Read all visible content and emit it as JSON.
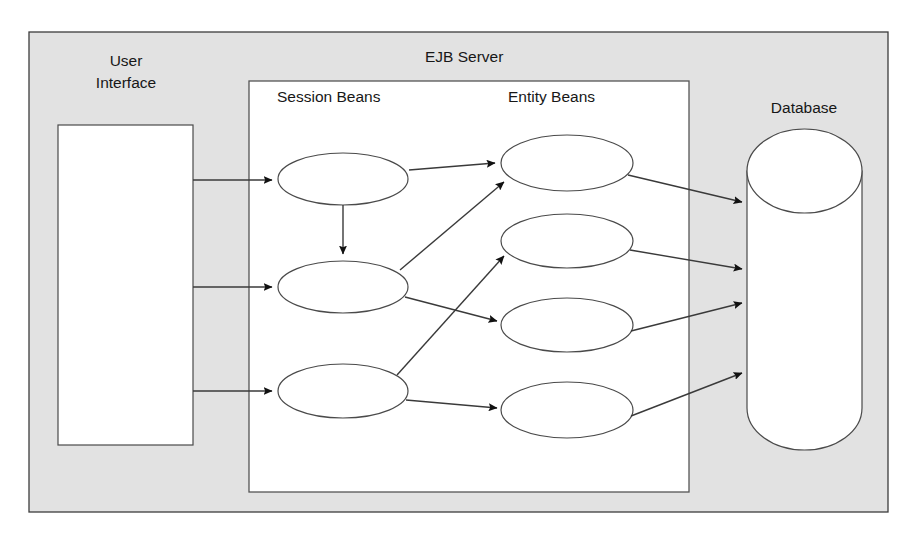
{
  "diagram": {
    "background_color": "#ffffff",
    "panel_fill": "#e2e2e2",
    "panel_stroke": "#3c3c3c",
    "node_fill": "#ffffff",
    "node_stroke": "#4a4a4a",
    "line_color": "#3a3a3a",
    "labels": {
      "ejb_server": "EJB Server",
      "user_interface_line1": "User",
      "user_interface_line2": "Interface",
      "session_beans": "Session Beans",
      "entity_beans": "Entity Beans",
      "database": "Database"
    },
    "outer_panel": {
      "x": 29,
      "y": 32,
      "width": 859,
      "height": 480
    },
    "inner_panel": {
      "x": 249,
      "y": 81,
      "width": 440,
      "height": 411
    },
    "user_interface_box": {
      "x": 58,
      "y": 125,
      "width": 135,
      "height": 320
    },
    "database_cylinder": {
      "x": 747,
      "y": 129,
      "width": 115,
      "height": 321,
      "cap_ry": 42
    },
    "session_beans": [
      {
        "id": "session-bean-1",
        "cx": 343,
        "cy": 179,
        "rx": 65,
        "ry": 26
      },
      {
        "id": "session-bean-2",
        "cx": 343,
        "cy": 287,
        "rx": 65,
        "ry": 26
      },
      {
        "id": "session-bean-3",
        "cx": 343,
        "cy": 391,
        "rx": 65,
        "ry": 27
      }
    ],
    "entity_beans": [
      {
        "id": "entity-bean-1",
        "cx": 567,
        "cy": 163,
        "rx": 66,
        "ry": 28
      },
      {
        "id": "entity-bean-2",
        "cx": 567,
        "cy": 241,
        "rx": 66,
        "ry": 27
      },
      {
        "id": "entity-bean-3",
        "cx": 567,
        "cy": 325,
        "rx": 66,
        "ry": 27
      },
      {
        "id": "entity-bean-4",
        "cx": 567,
        "cy": 410,
        "rx": 66,
        "ry": 28
      }
    ],
    "connections": [
      {
        "id": "ui-to-session-1",
        "from": "user-interface",
        "to": "session-bean-1",
        "d": "M 193 180 L 272 180"
      },
      {
        "id": "ui-to-session-2",
        "from": "user-interface",
        "to": "session-bean-2",
        "d": "M 193 287 L 272 287"
      },
      {
        "id": "ui-to-session-3",
        "from": "user-interface",
        "to": "session-bean-3",
        "d": "M 193 391 L 272 391"
      },
      {
        "id": "session-1-to-session-2",
        "from": "session-bean-1",
        "to": "session-bean-2",
        "d": "M 343 205 L 343 254"
      },
      {
        "id": "session-1-to-entity-1",
        "from": "session-bean-1",
        "to": "entity-bean-1",
        "d": "M 409 170 L 495 163"
      },
      {
        "id": "session-2-to-entity-1",
        "from": "session-bean-2",
        "to": "entity-bean-1",
        "d": "M 400 270 L 504 182"
      },
      {
        "id": "session-2-to-entity-3",
        "from": "session-bean-2",
        "to": "entity-bean-3",
        "d": "M 405 297 L 497 321"
      },
      {
        "id": "session-3-to-entity-2",
        "from": "session-bean-3",
        "to": "entity-bean-2",
        "d": "M 397 375 L 504 256"
      },
      {
        "id": "session-3-to-entity-4",
        "from": "session-bean-3",
        "to": "entity-bean-4",
        "d": "M 406 400 L 497 408"
      },
      {
        "id": "entity-1-to-database",
        "from": "entity-bean-1",
        "to": "database",
        "d": "M 628 175 L 742 202"
      },
      {
        "id": "entity-2-to-database",
        "from": "entity-bean-2",
        "to": "database",
        "d": "M 630 250 L 742 269"
      },
      {
        "id": "entity-3-to-database",
        "from": "entity-bean-3",
        "to": "database",
        "d": "M 631 331 L 742 303"
      },
      {
        "id": "entity-4-to-database",
        "from": "entity-bean-4",
        "to": "database",
        "d": "M 631 416 L 742 373"
      }
    ]
  }
}
